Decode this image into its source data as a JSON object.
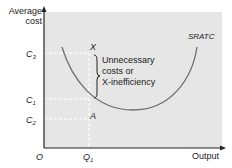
{
  "diagram": {
    "y_axis_label": [
      "Average",
      "cost"
    ],
    "x_axis_label": "Output",
    "origin_label": "O",
    "y_ticks": [
      {
        "name": "C",
        "sub": "3"
      },
      {
        "name": "C",
        "sub": "1"
      },
      {
        "name": "C",
        "sub": "2"
      }
    ],
    "x_ticks": [
      {
        "name": "Q",
        "sub": "1"
      }
    ],
    "points": {
      "X": "X",
      "A": "A"
    },
    "curve_label": "SRATC",
    "annotation": [
      "Unnecessary",
      "costs or",
      "X-inefficiency"
    ],
    "colors": {
      "panel": "#e6e6e6",
      "curve": "#6e6e6e",
      "axis": "#222222",
      "guide": "#ffffff"
    }
  }
}
